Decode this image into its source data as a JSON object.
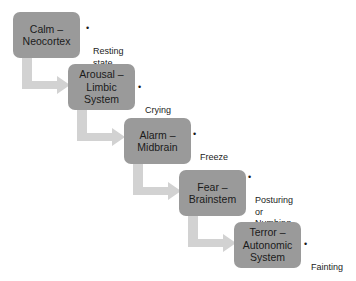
{
  "diagram": {
    "type": "staircase-flowchart",
    "box_fill_color": "#9a9a9a",
    "arrow_color": "#d2d2d2",
    "text_color": "#1b1b1b",
    "background_color": "#ffffff",
    "bullet_glyph": "•",
    "stages": [
      {
        "id": "calm",
        "label": "Calm –\nNeocortex",
        "note": "Resting\nstate",
        "box": {
          "x": 13,
          "y": 12,
          "w": 67,
          "h": 46
        },
        "note_pos": {
          "x": 86,
          "y": 23
        }
      },
      {
        "id": "arousal",
        "label": "Arousal –\nLimbic\nSystem",
        "note": "Crying",
        "box": {
          "x": 68,
          "y": 64,
          "w": 67,
          "h": 46
        },
        "note_pos": {
          "x": 138,
          "y": 82
        }
      },
      {
        "id": "alarm",
        "label": "Alarm –\nMidbrain",
        "note": "Freeze",
        "box": {
          "x": 124,
          "y": 118,
          "w": 67,
          "h": 46
        },
        "note_pos": {
          "x": 193,
          "y": 129
        }
      },
      {
        "id": "fear",
        "label": "Fear –\nBrainstem",
        "note": "Posturing\nor\nNumbing",
        "box": {
          "x": 179,
          "y": 170,
          "w": 67,
          "h": 46
        },
        "note_pos": {
          "x": 248,
          "y": 172
        }
      },
      {
        "id": "terror",
        "label": "Terror –\nAutonomic\nSystem",
        "note": "Fainting",
        "box": {
          "x": 234,
          "y": 222,
          "w": 67,
          "h": 46
        },
        "note_pos": {
          "x": 304,
          "y": 239
        }
      }
    ],
    "connectors": [
      {
        "id": "calm-to-arousal",
        "from": "calm",
        "to": "arousal"
      },
      {
        "id": "arousal-to-alarm",
        "from": "arousal",
        "to": "alarm"
      },
      {
        "id": "alarm-to-fear",
        "from": "alarm",
        "to": "fear"
      },
      {
        "id": "fear-to-terror",
        "from": "fear",
        "to": "terror"
      }
    ]
  }
}
